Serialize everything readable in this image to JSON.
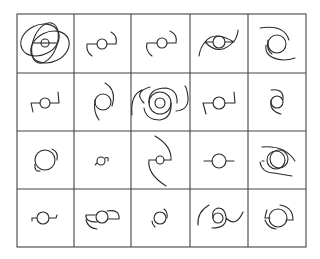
{
  "figure": {
    "type": "grid-of-spiral-glyphs",
    "rows": 4,
    "cols": 5,
    "line_color": "#2a2a2a",
    "grid_color": "#444444",
    "background": "#ffffff",
    "cells": [
      {
        "row": 0,
        "col": 0,
        "desc": "central small circle with bar, two large overlapping ellipse loops"
      },
      {
        "row": 0,
        "col": 1,
        "desc": "small circle with bar and two short hooked arms"
      },
      {
        "row": 0,
        "col": 2,
        "desc": "small circle with bar and two short hooked arms"
      },
      {
        "row": 0,
        "col": 3,
        "desc": "circle inside eye-shaped pair of long arcs"
      },
      {
        "row": 0,
        "col": 4,
        "desc": "circle with two long curved spiral arms"
      },
      {
        "row": 1,
        "col": 0,
        "desc": "small circle with bar and two short angled arms"
      },
      {
        "row": 1,
        "col": 1,
        "desc": "circle with two curved spiral arms"
      },
      {
        "row": 1,
        "col": 2,
        "desc": "concentric circles with large overlapping spiral arcs"
      },
      {
        "row": 1,
        "col": 3,
        "desc": "circle with bar and two angled arms"
      },
      {
        "row": 1,
        "col": 4,
        "desc": "circle with two curved spiral arms"
      },
      {
        "row": 2,
        "col": 0,
        "desc": "large circle with two short arcs"
      },
      {
        "row": 2,
        "col": 1,
        "desc": "tiny circle with two small hooks"
      },
      {
        "row": 2,
        "col": 2,
        "desc": "small circle with two long sweeping arms"
      },
      {
        "row": 2,
        "col": 3,
        "desc": "circle with straight bar extensions"
      },
      {
        "row": 2,
        "col": 4,
        "desc": "two overlapping circles with hooked arcs"
      },
      {
        "row": 3,
        "col": 0,
        "desc": "small circle with bar and short hooks"
      },
      {
        "row": 3,
        "col": 1,
        "desc": "circle with two half-disc arcs"
      },
      {
        "row": 3,
        "col": 2,
        "desc": "circle with two short tight arcs"
      },
      {
        "row": 3,
        "col": 3,
        "desc": "small circle with two long spiral arms"
      },
      {
        "row": 3,
        "col": 4,
        "desc": "circle with two offset arcs"
      }
    ]
  }
}
